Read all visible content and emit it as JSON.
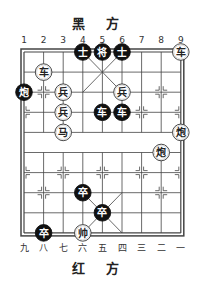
{
  "top_label": "黑 方",
  "bottom_label": "红 方",
  "top_files": [
    "1",
    "2",
    "3",
    "4",
    "5",
    "6",
    "7",
    "8",
    "9"
  ],
  "bottom_files": [
    "九",
    "八",
    "七",
    "六",
    "五",
    "四",
    "三",
    "二",
    "一"
  ],
  "board": {
    "x0": 24,
    "y0": 52,
    "dx": 19.6,
    "dy": 20.1,
    "line_color": "#444444",
    "red_piece_fill": "#ffffff",
    "black_piece_fill": "#111111"
  },
  "pieces": [
    {
      "side": "black",
      "char": "士",
      "file": 4,
      "rank": 0
    },
    {
      "side": "black",
      "char": "将",
      "file": 5,
      "rank": 0
    },
    {
      "side": "black",
      "char": "士",
      "file": 6,
      "rank": 0
    },
    {
      "side": "red",
      "char": "车",
      "file": 9,
      "rank": 0
    },
    {
      "side": "red",
      "char": "车",
      "file": 2,
      "rank": 1
    },
    {
      "side": "black",
      "char": "炮",
      "file": 1,
      "rank": 2
    },
    {
      "side": "red",
      "char": "兵",
      "file": 3,
      "rank": 2
    },
    {
      "side": "red",
      "char": "兵",
      "file": 6,
      "rank": 2
    },
    {
      "side": "red",
      "char": "兵",
      "file": 3,
      "rank": 3
    },
    {
      "side": "black",
      "char": "车",
      "file": 5,
      "rank": 3
    },
    {
      "side": "black",
      "char": "车",
      "file": 6,
      "rank": 3
    },
    {
      "side": "red",
      "char": "马",
      "file": 3,
      "rank": 4
    },
    {
      "side": "red",
      "char": "炮",
      "file": 9,
      "rank": 4
    },
    {
      "side": "red",
      "char": "炮",
      "file": 8,
      "rank": 5
    },
    {
      "side": "black",
      "char": "卒",
      "file": 4,
      "rank": 7
    },
    {
      "side": "black",
      "char": "卒",
      "file": 5,
      "rank": 8
    },
    {
      "side": "black",
      "char": "卒",
      "file": 2,
      "rank": 9
    },
    {
      "side": "red",
      "char": "帅",
      "file": 4,
      "rank": 9
    }
  ]
}
